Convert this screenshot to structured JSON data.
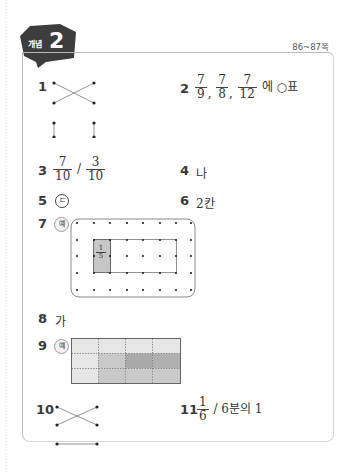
{
  "header": {
    "badge_label": "개념",
    "badge_number": "2",
    "page_range": "86~87쪽"
  },
  "answers": {
    "q1": {
      "number": "1",
      "type": "dot-matching",
      "description": "Top pair crossed (X), bottom two vertical lines"
    },
    "q2": {
      "number": "2",
      "fractions": [
        {
          "n": "7",
          "d": "9"
        },
        {
          "n": "7",
          "d": "8"
        },
        {
          "n": "7",
          "d": "12"
        }
      ],
      "separator": ",",
      "suffix": "에 ○표"
    },
    "q3": {
      "number": "3",
      "fractions": [
        {
          "n": "7",
          "d": "10"
        },
        {
          "n": "3",
          "d": "10"
        }
      ],
      "separator": "/"
    },
    "q4": {
      "number": "4",
      "text": "나"
    },
    "q5": {
      "number": "5",
      "text": "ㄷ"
    },
    "q6": {
      "number": "6",
      "text": "2칸"
    },
    "q7": {
      "number": "7",
      "example_label": "예",
      "shaded_fraction": {
        "n": "1",
        "d": "5"
      },
      "grid_cols": 8,
      "grid_rows": 5
    },
    "q8": {
      "number": "8",
      "text": "가"
    },
    "q9": {
      "number": "9",
      "example_label": "예",
      "grid_cols": 4,
      "grid_rows": 3
    },
    "q10": {
      "number": "10",
      "type": "dot-matching",
      "description": "Top pair crossed (X), bottom horizontal line"
    },
    "q11": {
      "number": "11",
      "fraction": {
        "n": "1",
        "d": "6"
      },
      "separator": "/",
      "text": "6분의 1"
    }
  },
  "colors": {
    "badge": "#3d3d3d",
    "panel_border": "#bbbbbb",
    "shade_light": "#e6e6e6",
    "shade_mid": "#c8c8c8",
    "shade_dark": "#a9a9a9"
  }
}
